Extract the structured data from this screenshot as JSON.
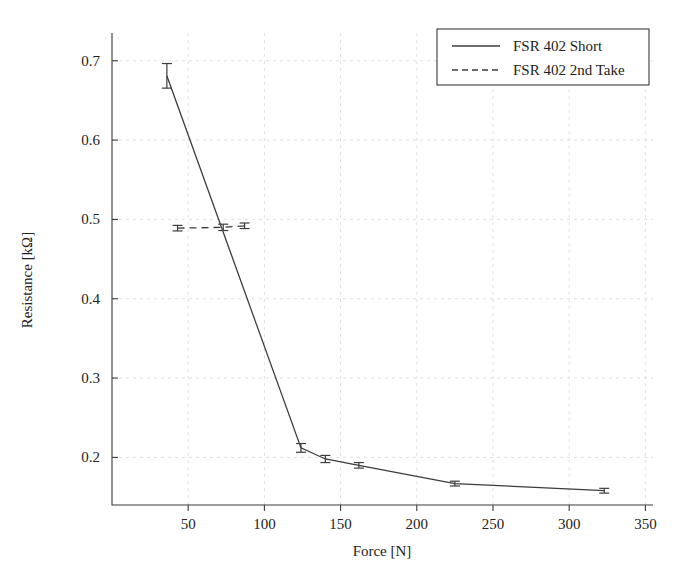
{
  "chart_data": {
    "type": "line",
    "title": "",
    "xlabel": "Force [N]",
    "ylabel": "Resistance [kΩ]",
    "xlim": [
      0,
      355
    ],
    "ylim": [
      0.14,
      0.735
    ],
    "xticks": [
      50,
      100,
      150,
      200,
      250,
      300,
      350
    ],
    "xtick_labels": [
      "50",
      "100",
      "150",
      "200",
      "250",
      "300",
      "350"
    ],
    "yticks": [
      0.2,
      0.3,
      0.4,
      0.5,
      0.6,
      0.7
    ],
    "ytick_labels": [
      "0.2",
      "0.3",
      "0.4",
      "0.5",
      "0.6",
      "0.7"
    ],
    "grid": true,
    "legend_position": "top-right",
    "series": [
      {
        "name": "FSR 402 Short",
        "style": "solid",
        "color": "#3c3c3c",
        "x": [
          36,
          124,
          140,
          162,
          225,
          323
        ],
        "y": [
          0.681,
          0.212,
          0.198,
          0.19,
          0.167,
          0.158
        ],
        "yerr": [
          0.0155,
          0.0055,
          0.0045,
          0.0035,
          0.003,
          0.003
        ]
      },
      {
        "name": "FSR 402 2nd Take",
        "style": "dashed",
        "color": "#3c3c3c",
        "x": [
          43,
          73,
          87
        ],
        "y": [
          0.489,
          0.49,
          0.492
        ],
        "yerr": [
          0.0035,
          0.004,
          0.0035
        ]
      }
    ]
  },
  "legend": {
    "entries": [
      {
        "label": "FSR 402 Short",
        "style": "solid"
      },
      {
        "label": "FSR 402 2nd Take",
        "style": "dashed"
      }
    ]
  },
  "axes": {
    "x_title": "Force [N]",
    "y_title": "Resistance [kΩ]"
  }
}
